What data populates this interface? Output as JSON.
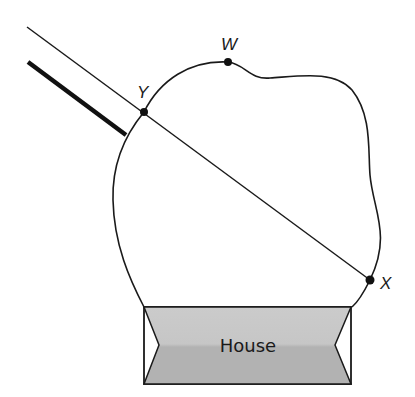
{
  "diagram": {
    "points": [
      {
        "id": "W",
        "label": "W",
        "x": 228,
        "y": 62
      },
      {
        "id": "Y",
        "label": "Y",
        "x": 144,
        "y": 112
      },
      {
        "id": "X",
        "label": "X",
        "x": 370,
        "y": 280
      }
    ],
    "segments": [
      {
        "name": "line-through-Y-X",
        "from": [
          27,
          27
        ],
        "to": [
          370,
          280
        ],
        "style": "thin"
      },
      {
        "name": "thick-line",
        "from": [
          28,
          62
        ],
        "to": [
          126,
          135
        ],
        "style": "thick"
      }
    ],
    "house": {
      "label": "House"
    },
    "colors": {
      "stroke": "#1a1a1a",
      "house_fill_top": "#c9c9c9",
      "house_fill_bottom": "#b3b3b3",
      "background": "#ffffff"
    }
  }
}
